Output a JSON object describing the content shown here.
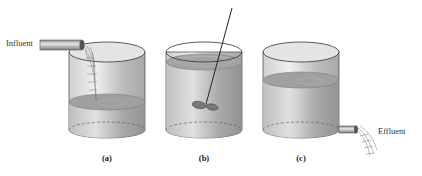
{
  "diagram": {
    "labels": {
      "influent": "Influent",
      "effluent": "Effluent"
    },
    "panels": [
      {
        "id": "a",
        "caption": "(a)",
        "description": "Tank being filled by influent pipe"
      },
      {
        "id": "b",
        "caption": "(b)",
        "description": "Full tank with mixing impeller"
      },
      {
        "id": "c",
        "caption": "(c)",
        "description": "Tank draining through effluent pipe"
      }
    ],
    "colors": {
      "tank_wall": "#d9d9d9",
      "liquid": "#9a9a9a",
      "outline": "#333333"
    }
  }
}
